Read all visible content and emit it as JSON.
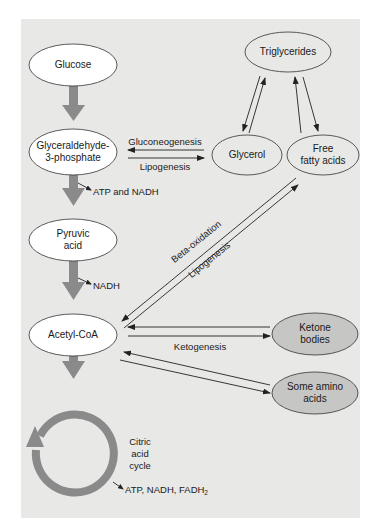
{
  "diagram": {
    "colors": {
      "panel": "#e8e8e6",
      "node_white": "#ffffff",
      "node_gray": "#c6c6c4",
      "main_flow_arrow": "#8a8a8a",
      "line": "#222222"
    },
    "nodes": {
      "glucose": "Glucose",
      "g3p_line1": "Glyceraldehyde-",
      "g3p_line2": "3-phosphate",
      "pyruvic_line1": "Pyruvic",
      "pyruvic_line2": "acid",
      "acetyl_coa": "Acetyl-CoA",
      "triglycerides": "Triglycerides",
      "glycerol": "Glycerol",
      "ffa_line1": "Free",
      "ffa_line2": "fatty acids",
      "ketone_line1": "Ketone",
      "ketone_line2": "bodies",
      "amino_line1": "Some amino",
      "amino_line2": "acids"
    },
    "labels": {
      "gluconeogenesis": "Gluconeogenesis",
      "lipogenesis_1": "Lipogenesis",
      "atp_nadh": "ATP and NADH",
      "nadh": "NADH",
      "beta_oxidation": "Beta-oxidation",
      "lipogenesis_2": "Lipogenesis",
      "ketogenesis": "Ketogenesis",
      "citric_line1": "Citric",
      "citric_line2": "acid",
      "citric_line3": "cycle",
      "cycle_products_prefix": "ATP, NADH, FADH",
      "cycle_products_sub": "2"
    }
  }
}
